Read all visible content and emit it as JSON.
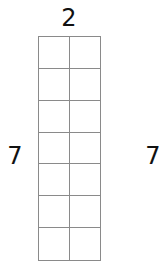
{
  "diagram": {
    "type": "grid",
    "columns": 2,
    "rows": 7,
    "labels": {
      "top": "2",
      "left": "7",
      "right": "7"
    },
    "line_color": "#8a8a8a",
    "text_color": "#111111"
  }
}
